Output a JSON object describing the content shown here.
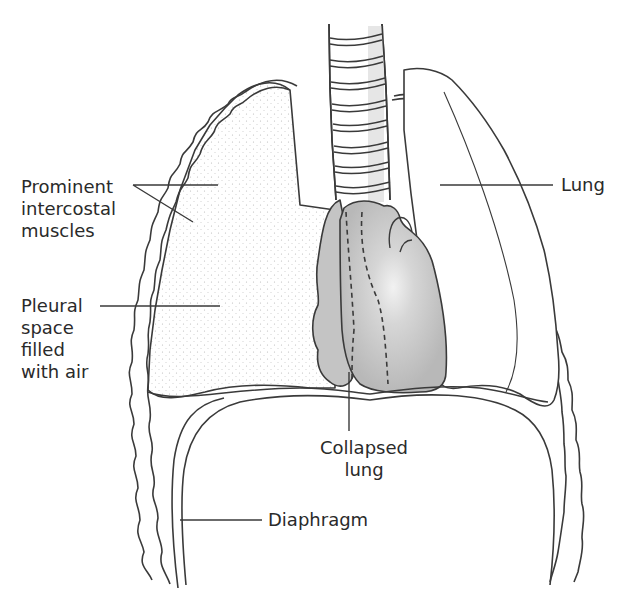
{
  "diagram": {
    "labels": {
      "intercostal": [
        "Prominent",
        "intercostal",
        "muscles"
      ],
      "pleural": [
        "Pleural",
        "space",
        "filled",
        "with air"
      ],
      "lung": "Lung",
      "collapsed": [
        "Collapsed",
        "lung"
      ],
      "diaphragm": "Diaphragm"
    },
    "colors": {
      "line": "#3a3a3a",
      "collapsed_lung_fill": "#c4c4c4",
      "heart_fill": "#bdbdbd",
      "pleural_stipple": "#d9d9d9",
      "background": "#ffffff"
    }
  }
}
